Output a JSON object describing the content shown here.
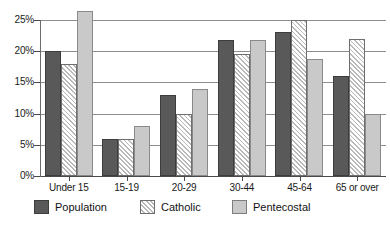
{
  "chart_data": {
    "type": "bar",
    "title": "",
    "subtitle": "",
    "xlabel": "",
    "ylabel": "",
    "categories": [
      "Under 15",
      "15-19",
      "20-29",
      "30-44",
      "45-64",
      "65 or over"
    ],
    "series": [
      {
        "name": "Population",
        "values": [
          20.0,
          6.0,
          13.0,
          21.8,
          23.0,
          16.0
        ]
      },
      {
        "name": "Catholic",
        "values": [
          18.0,
          6.0,
          10.0,
          19.5,
          25.0,
          22.0
        ]
      },
      {
        "name": "Pentecostal",
        "values": [
          26.5,
          8.0,
          14.0,
          21.8,
          18.8,
          10.0
        ]
      }
    ],
    "ylim": [
      0,
      27
    ],
    "yticks": [
      0,
      5,
      10,
      15,
      20,
      25
    ],
    "ytick_labels": [
      "0%",
      "5%",
      "10%",
      "15%",
      "20%",
      "25%"
    ],
    "grid": true,
    "grid_axis": "y",
    "legend_position": "bottom",
    "colors": {
      "population": "#595959",
      "catholic": "#ffffff",
      "pentecostal": "#c9c9c9",
      "gridline": "#8d8d8d",
      "axis": "#4a4a4a",
      "text": "#111111"
    },
    "series_fill_styles": [
      "solid",
      "diagonal-hatch",
      "solid"
    ]
  },
  "legend": {
    "items": [
      {
        "label": "Population",
        "style": "population"
      },
      {
        "label": "Catholic",
        "style": "catholic"
      },
      {
        "label": "Pentecostal",
        "style": "pentecostal"
      }
    ]
  }
}
